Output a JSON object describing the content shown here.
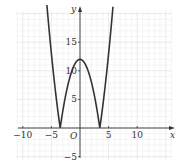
{
  "chart_data": {
    "type": "line",
    "title": "",
    "function": "y = |x^2 - 12|",
    "xlabel": "x",
    "ylabel": "y",
    "origin_label": "O",
    "xlim": [
      -12,
      16
    ],
    "ylim": [
      -6,
      21
    ],
    "grid": true,
    "x_ticks": [
      -10,
      -5,
      5,
      10
    ],
    "x_tick_labels": [
      "−10",
      "−5",
      "5",
      "10"
    ],
    "y_ticks": [
      -5,
      5,
      10,
      15
    ],
    "y_tick_labels": [
      "−5",
      "5",
      "10",
      "15"
    ],
    "series": [
      {
        "name": "y = |x² − 12|",
        "x": [
          -5.8,
          -5,
          -4,
          -3.46,
          -3,
          -2,
          -1,
          0,
          1,
          2,
          3,
          3.46,
          4,
          5,
          5.8
        ],
        "values": [
          21.6,
          13,
          4,
          0,
          3,
          8,
          11,
          12,
          11,
          8,
          3,
          0,
          4,
          13,
          21.6
        ]
      }
    ],
    "key_points": {
      "vertex": [
        0,
        12
      ],
      "zeros": [
        -3.46,
        3.46
      ]
    },
    "colors": {
      "curve": "#333333",
      "grid": "#e6e6e6",
      "axis": "#333333"
    }
  }
}
